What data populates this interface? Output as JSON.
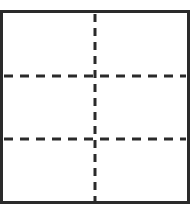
{
  "diagram": {
    "border_color": "#2a2a2a",
    "line_color": "#2a2a2a",
    "vertical_lines": [
      95
    ],
    "horizontal_lines": [
      76,
      139
    ],
    "regions": 6
  }
}
